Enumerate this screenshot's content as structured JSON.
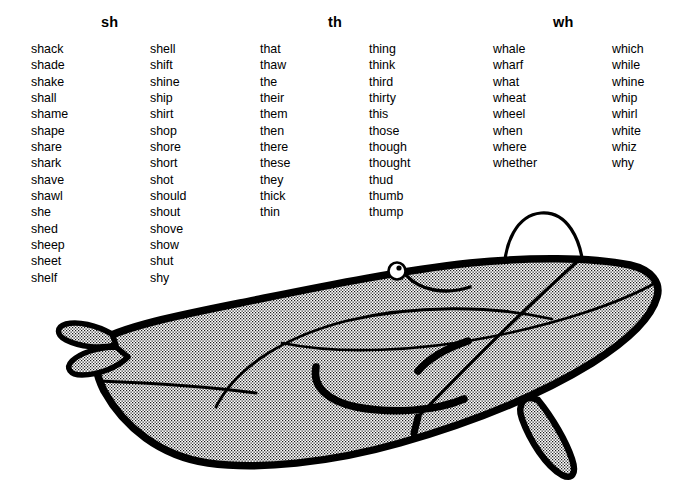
{
  "page": {
    "background_color": "#ffffff",
    "text_color": "#000000"
  },
  "headers": [
    {
      "label": "sh",
      "x": 101
    },
    {
      "label": "th",
      "x": 328
    },
    {
      "label": "wh",
      "x": 553
    }
  ],
  "columns": [
    {
      "name": "sh-column-1",
      "x": 31,
      "words": [
        "shack",
        "shade",
        "shake",
        "shall",
        "shame",
        "shape",
        "share",
        "shark",
        "shave",
        "shawl",
        "she",
        "shed",
        "sheep",
        "sheet",
        "shelf"
      ]
    },
    {
      "name": "sh-column-2",
      "x": 150,
      "words": [
        "shell",
        "shift",
        "shine",
        "ship",
        "shirt",
        "shop",
        "shore",
        "short",
        "shot",
        "should",
        "shout",
        "shove",
        "show",
        "shut",
        "shy"
      ]
    },
    {
      "name": "th-column-1",
      "x": 260,
      "words": [
        "that",
        "thaw",
        "the",
        "their",
        "them",
        "then",
        "there",
        "these",
        "they",
        "thick",
        "thin"
      ]
    },
    {
      "name": "th-column-2",
      "x": 369,
      "words": [
        "thing",
        "think",
        "third",
        "thirty",
        "this",
        "those",
        "though",
        "thought",
        "thud",
        "thumb",
        "thump"
      ]
    },
    {
      "name": "wh-column-1",
      "x": 493,
      "words": [
        "whale",
        "wharf",
        "what",
        "wheat",
        "wheel",
        "when",
        "where",
        "whether"
      ]
    },
    {
      "name": "wh-column-2",
      "x": 612,
      "words": [
        "which",
        "while",
        "whine",
        "whip",
        "whirl",
        "white",
        "whiz",
        "why"
      ]
    }
  ],
  "illustration": {
    "subject": "whale",
    "style": "black line art with halftone dot shading",
    "outline_color": "#000000",
    "fill_pattern": "halftone-dots",
    "parts": [
      "body",
      "tail-flukes",
      "eye",
      "mouth",
      "flipper",
      "water-spout",
      "belly-lines"
    ]
  }
}
